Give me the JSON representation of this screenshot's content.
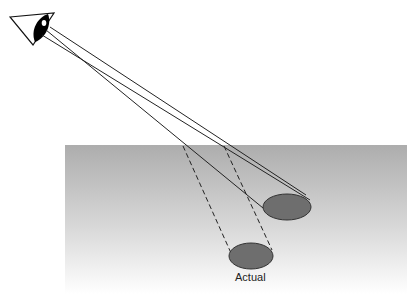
{
  "diagram": {
    "title": "",
    "labels": {
      "actual": "Actual"
    },
    "colors": {
      "water_top": "#b0b0b0",
      "water_bottom": "#ffffff",
      "object_fill": "#6e6e6e",
      "line": "#222222"
    },
    "elements": [
      "eye",
      "sight-lines",
      "water-surface",
      "apparent-object",
      "actual-object",
      "refracted-dashed-lines"
    ]
  }
}
